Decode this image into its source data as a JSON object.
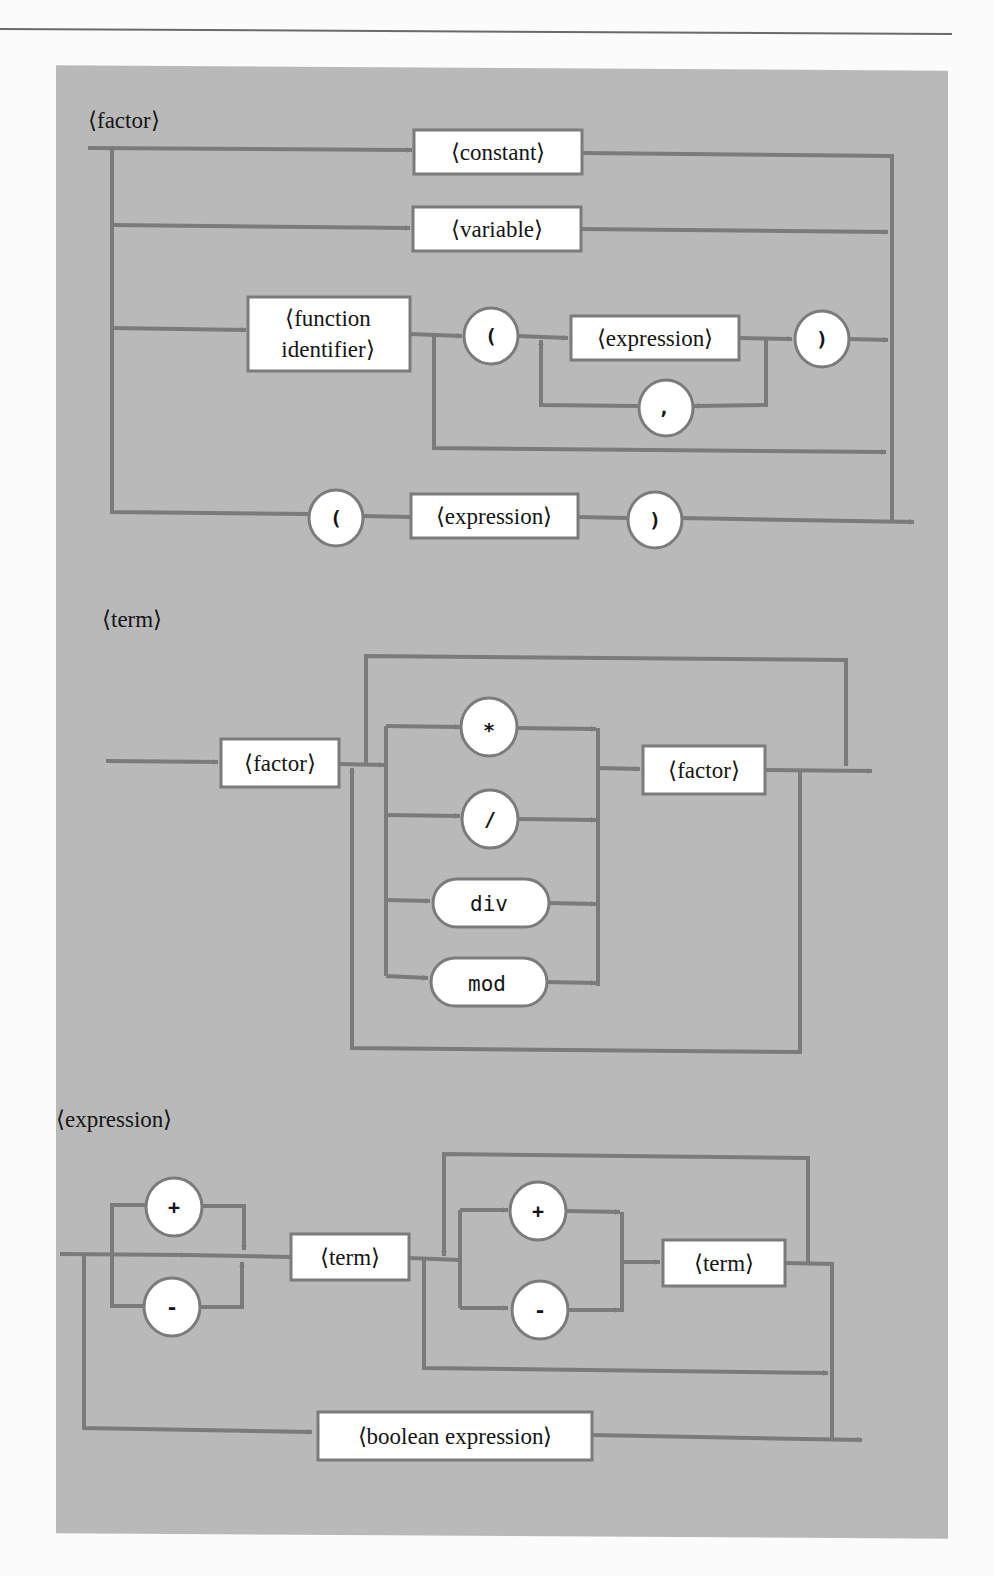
{
  "colors": {
    "panel_bg": "#b9b9b9",
    "line": "#7b7b7b",
    "node_fill": "#ffffff",
    "text": "#151515"
  },
  "diagrams": {
    "factor": {
      "title": "⟨factor⟩",
      "nodes": {
        "constant": "⟨constant⟩",
        "variable": "⟨variable⟩",
        "function_identifier_line1": "⟨function",
        "function_identifier_line2": "identifier⟩",
        "open_paren": "(",
        "expression_arg": "⟨expression⟩",
        "comma": ",",
        "close_paren": ")",
        "group_open_paren": "(",
        "group_expression": "⟨expression⟩",
        "group_close_paren": ")"
      }
    },
    "term": {
      "title": "⟨term⟩",
      "nodes": {
        "first_factor": "⟨factor⟩",
        "multiply": "*",
        "divide": "/",
        "div": "div",
        "mod": "mod",
        "second_factor": "⟨factor⟩"
      }
    },
    "expression": {
      "title": "⟨expression⟩",
      "nodes": {
        "unary_plus": "+",
        "unary_minus": "-",
        "first_term": "⟨term⟩",
        "binary_plus": "+",
        "binary_minus": "-",
        "second_term": "⟨term⟩",
        "boolean_expression": "⟨boolean expression⟩"
      }
    }
  }
}
